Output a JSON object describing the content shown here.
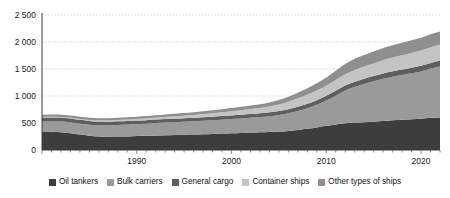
{
  "chart_data": {
    "type": "area",
    "stacked": true,
    "title": "",
    "subtitle": "",
    "xlabel": "",
    "ylabel": "",
    "xlim": [
      1980,
      2022
    ],
    "ylim": [
      0,
      2500
    ],
    "grid": true,
    "legend_position": "bottom",
    "x_tick_labels": [
      "1990",
      "2000",
      "2010",
      "2020"
    ],
    "x_ticks": [
      1990,
      2000,
      2010,
      2020
    ],
    "y_tick_labels": [
      "0",
      "500",
      "1 000",
      "1 500",
      "2 000",
      "2 500"
    ],
    "y_ticks": [
      0,
      500,
      1000,
      1500,
      2000,
      2500
    ],
    "x": [
      1980,
      1981,
      1982,
      1983,
      1984,
      1985,
      1986,
      1987,
      1988,
      1989,
      1990,
      1991,
      1992,
      1993,
      1994,
      1995,
      1996,
      1997,
      1998,
      1999,
      2000,
      2001,
      2002,
      2003,
      2004,
      2005,
      2006,
      2007,
      2008,
      2009,
      2010,
      2011,
      2012,
      2013,
      2014,
      2015,
      2016,
      2017,
      2018,
      2019,
      2020,
      2021,
      2022
    ],
    "series": [
      {
        "name": "Oil tankers",
        "color": "#3d3d3d",
        "values": [
          340,
          340,
          330,
          310,
          285,
          265,
          250,
          245,
          248,
          252,
          258,
          262,
          268,
          273,
          278,
          282,
          286,
          292,
          298,
          304,
          310,
          316,
          322,
          327,
          333,
          341,
          354,
          372,
          392,
          418,
          448,
          474,
          496,
          508,
          516,
          524,
          536,
          550,
          562,
          570,
          580,
          596,
          604
        ]
      },
      {
        "name": "Bulk carriers",
        "color": "#9a9a9a",
        "values": [
          186,
          190,
          196,
          200,
          202,
          204,
          208,
          212,
          216,
          220,
          222,
          226,
          230,
          234,
          238,
          242,
          246,
          250,
          254,
          258,
          262,
          268,
          274,
          282,
          292,
          306,
          326,
          352,
          382,
          420,
          470,
          532,
          604,
          662,
          708,
          748,
          782,
          808,
          828,
          852,
          876,
          912,
          942
        ]
      },
      {
        "name": "General cargo",
        "color": "#5e5e5e",
        "values": [
          74,
          74,
          74,
          73,
          72,
          70,
          69,
          68,
          67,
          66,
          66,
          65,
          65,
          65,
          65,
          65,
          65,
          66,
          66,
          67,
          68,
          69,
          70,
          71,
          72,
          74,
          76,
          78,
          81,
          84,
          87,
          90,
          93,
          95,
          97,
          98,
          99,
          100,
          101,
          102,
          103,
          105,
          106
        ]
      },
      {
        "name": "Container ships",
        "color": "#c4c4c4",
        "values": [
          11,
          12,
          13,
          15,
          16,
          18,
          20,
          22,
          24,
          26,
          28,
          31,
          34,
          38,
          42,
          46,
          51,
          57,
          64,
          70,
          77,
          84,
          91,
          99,
          109,
          122,
          138,
          155,
          172,
          180,
          186,
          198,
          208,
          218,
          226,
          234,
          245,
          253,
          262,
          274,
          282,
          288,
          296
        ]
      },
      {
        "name": "Other types of ships",
        "color": "#8f8f8f",
        "values": [
          41,
          41,
          41,
          41,
          41,
          41,
          41,
          41,
          42,
          42,
          43,
          44,
          45,
          46,
          47,
          48,
          50,
          52,
          54,
          57,
          60,
          63,
          66,
          70,
          75,
          82,
          92,
          104,
          118,
          134,
          152,
          172,
          192,
          206,
          214,
          220,
          226,
          230,
          234,
          236,
          240,
          244,
          248
        ]
      }
    ]
  },
  "legend": {
    "items": [
      {
        "label": "Oil tankers",
        "color": "#3d3d3d"
      },
      {
        "label": "Bulk carriers",
        "color": "#9a9a9a"
      },
      {
        "label": "General cargo",
        "color": "#5e5e5e"
      },
      {
        "label": "Container ships",
        "color": "#c4c4c4"
      },
      {
        "label": "Other types of ships",
        "color": "#8f8f8f"
      }
    ]
  }
}
